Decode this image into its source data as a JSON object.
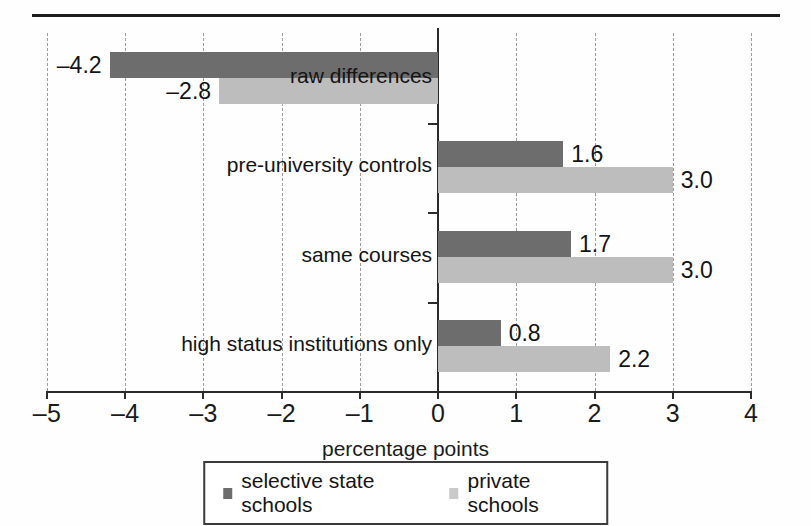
{
  "chart_data": {
    "type": "bar",
    "orientation": "horizontal",
    "title": "",
    "xlabel": "percentage points",
    "ylabel": "",
    "xlim": [
      -5,
      4
    ],
    "xticks": [
      "–5",
      "–4",
      "–3",
      "–2",
      "–1",
      "0",
      "1",
      "2",
      "3",
      "4"
    ],
    "xtick_values": [
      -5,
      -4,
      -3,
      -2,
      -1,
      0,
      1,
      2,
      3,
      4
    ],
    "grid": "vertical dashed gridlines at each integer tick",
    "legend_position": "bottom-center",
    "categories": [
      "raw differences",
      "pre-university controls",
      "same courses",
      "high status institutions only"
    ],
    "series": [
      {
        "name": "selective state schools",
        "color": "#6d6d6d",
        "values": [
          -4.2,
          1.6,
          1.7,
          0.8
        ],
        "labels": [
          "–4.2",
          "1.6",
          "1.7",
          "0.8"
        ]
      },
      {
        "name": "private schools",
        "color": "#bdbdbd",
        "values": [
          -2.8,
          3.0,
          3.0,
          2.2
        ],
        "labels": [
          "–2.8",
          "3.0",
          "3.0",
          "2.2"
        ]
      }
    ]
  },
  "legend": {
    "entries": [
      {
        "label": "selective state schools",
        "swatch": "dark-square-marker"
      },
      {
        "label": "private schools",
        "swatch": "light-square-marker"
      }
    ]
  },
  "colors": {
    "selective_state_schools": "#6d6d6d",
    "private_schools": "#bdbdbd",
    "axis": "#2b2b2b",
    "gridline": "#9a9a9a",
    "text": "#1b1b1b"
  }
}
